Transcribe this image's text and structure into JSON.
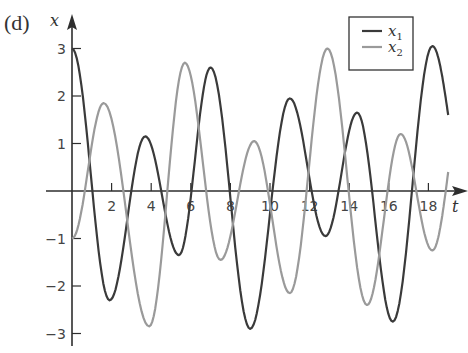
{
  "panel_label": "(d)",
  "chart_data": {
    "type": "line",
    "title": "",
    "xlabel": "t",
    "ylabel": "x",
    "xlim": [
      0,
      19.6
    ],
    "ylim": [
      -3.3,
      3.3
    ],
    "xticks": [
      2,
      4,
      6,
      8,
      10,
      12,
      14,
      16,
      18
    ],
    "xtick_labels": [
      "2",
      "4",
      "6",
      "8",
      "10",
      "12",
      "14",
      "16",
      "18"
    ],
    "yticks": [
      -3,
      -2,
      -1,
      1,
      2,
      3
    ],
    "ytick_labels": [
      "−3",
      "−2",
      "−1",
      "1",
      "2",
      "3"
    ],
    "grid": false,
    "legend_position": "upper right",
    "series": [
      {
        "name": "x1",
        "label_base": "x",
        "label_sub": "1",
        "color": "#3a3a3a",
        "extrema_t": [
          0,
          1.9,
          3.7,
          5.4,
          7.0,
          9.0,
          11.0,
          12.8,
          14.4,
          16.2,
          18.2,
          19.0
        ],
        "extrema_x": [
          3.0,
          -2.3,
          1.15,
          -1.35,
          2.6,
          -2.9,
          1.95,
          -0.95,
          1.65,
          -2.75,
          3.05,
          1.6
        ]
      },
      {
        "name": "x2",
        "label_base": "x",
        "label_sub": "2",
        "color": "#9a9a9a",
        "extrema_t": [
          0,
          1.6,
          3.9,
          5.7,
          7.5,
          9.2,
          11.0,
          12.9,
          14.9,
          16.6,
          18.2,
          19.0
        ],
        "extrema_x": [
          -1.0,
          1.85,
          -2.85,
          2.7,
          -1.45,
          1.05,
          -2.15,
          3.0,
          -2.4,
          1.2,
          -1.25,
          0.4
        ]
      }
    ]
  }
}
